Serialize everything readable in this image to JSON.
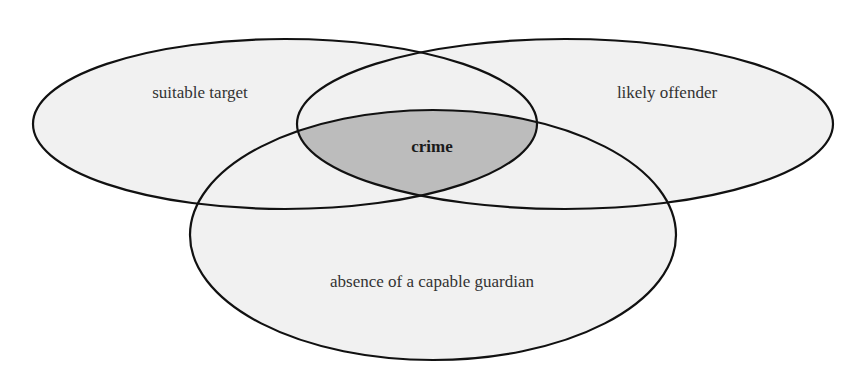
{
  "diagram": {
    "type": "venn",
    "title": "",
    "sets": [
      {
        "id": "target",
        "label": "suitable target",
        "cx": 285,
        "cy": 124,
        "rx": 252,
        "ry": 85,
        "label_x": 200,
        "label_y": 98
      },
      {
        "id": "offender",
        "label": "likely offender",
        "cx": 565,
        "cy": 124,
        "rx": 268,
        "ry": 85,
        "label_x": 667,
        "label_y": 98
      },
      {
        "id": "guardian",
        "label": "absence of a capable guardian",
        "cx": 433,
        "cy": 235,
        "rx": 243,
        "ry": 125,
        "label_x": 432,
        "label_y": 287
      }
    ],
    "intersection": {
      "label": "crime",
      "label_x": 432,
      "label_y": 152,
      "sets": [
        "target",
        "offender",
        "guardian"
      ]
    },
    "colors": {
      "fill": "#f1f1f1",
      "intersection_fill": "#bcbcbc",
      "stroke": "#111111"
    }
  }
}
